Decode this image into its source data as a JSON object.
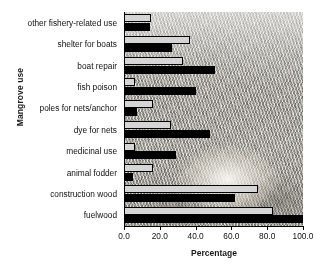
{
  "chart_data": {
    "type": "bar",
    "orientation": "horizontal",
    "title": "",
    "xlabel": "Percentage",
    "ylabel": "Mangrove use",
    "xlim": [
      0.0,
      100.0
    ],
    "xticks": [
      "0.0",
      "20.0",
      "40.0",
      "60.0",
      "80.0",
      "100.0"
    ],
    "xtick_values": [
      0,
      20,
      40,
      60,
      80,
      100
    ],
    "grid": false,
    "legend": "none",
    "categories": [
      "other fishery-related use",
      "shelter for boats",
      "boat repair",
      "fish poison",
      "poles for nets/anchor",
      "dye for nets",
      "medicinal use",
      "animal fodder",
      "construction wood",
      "fuelwood"
    ],
    "series": [
      {
        "name": "series-light",
        "color": "#d5d5d5",
        "values": [
          15.0,
          37.0,
          33.0,
          6.0,
          16.0,
          26.0,
          6.0,
          16.0,
          75.0,
          83.0
        ]
      },
      {
        "name": "series-dark",
        "color": "#000000",
        "values": [
          14.5,
          27.0,
          51.0,
          40.0,
          7.0,
          48.0,
          29.0,
          5.0,
          62.0,
          100.0
        ]
      }
    ],
    "background": "photograph of mangrove vegetation"
  }
}
